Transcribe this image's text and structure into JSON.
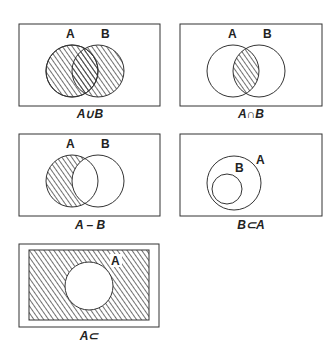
{
  "diagrams": [
    {
      "id": "union",
      "caption": "A∪B",
      "labels": {
        "a": "A",
        "b": "B"
      }
    },
    {
      "id": "intersection",
      "caption": "A∩B",
      "labels": {
        "a": "A",
        "b": "B"
      }
    },
    {
      "id": "difference",
      "caption": "A – B",
      "labels": {
        "a": "A",
        "b": "B"
      }
    },
    {
      "id": "subset",
      "caption": "B⊂A",
      "labels": {
        "a": "A",
        "b": "B"
      }
    },
    {
      "id": "complement",
      "caption": "A⊂",
      "labels": {
        "a": "A"
      }
    }
  ],
  "colors": {
    "stroke": "#333333",
    "hatch": "#333333",
    "background": "#ffffff"
  }
}
